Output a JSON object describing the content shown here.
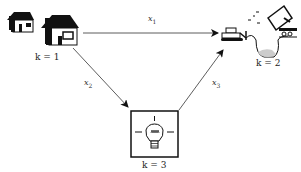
{
  "diagram": {
    "nodes": [
      {
        "id": "k1",
        "label": "k = 1",
        "icon": "houses-icon",
        "description": "residential houses"
      },
      {
        "id": "k2",
        "label": "k = 2",
        "icon": "landfill-icon",
        "description": "bulldozer, dump truck and landfill pit"
      },
      {
        "id": "k3",
        "label": "k = 3",
        "icon": "lightbulb-icon",
        "description": "light bulb in framed box"
      }
    ],
    "edges": [
      {
        "from": "k1",
        "to": "k2",
        "label": "x",
        "sub": "1"
      },
      {
        "from": "k1",
        "to": "k3",
        "label": "x",
        "sub": "2"
      },
      {
        "from": "k3",
        "to": "k2",
        "label": "x",
        "sub": "3"
      }
    ],
    "colors": {
      "line": "#333333",
      "fill": "#111111",
      "pit": "#cccccc"
    }
  }
}
